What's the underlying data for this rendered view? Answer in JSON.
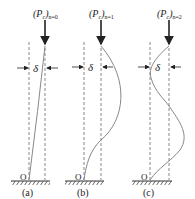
{
  "diagram": {
    "colors": {
      "line": "#333333",
      "curve": "#888888",
      "dashed": "#555555",
      "text": "#222222"
    },
    "panels": [
      {
        "id": "a",
        "load_label_main": "(P",
        "load_label_sub_c": "c",
        "load_label_close": ")",
        "load_label_sub_n": "n=0",
        "delta_symbol": "δ",
        "origin_label": "O",
        "caption": "(a)"
      },
      {
        "id": "b",
        "load_label_main": "(P",
        "load_label_sub_c": "c",
        "load_label_close": ")",
        "load_label_sub_n": "n=1",
        "delta_symbol": "δ",
        "origin_label": "O",
        "caption": "(b)"
      },
      {
        "id": "c",
        "load_label_main": "(P",
        "load_label_sub_c": "c",
        "load_label_close": ")",
        "load_label_sub_n": "n=2",
        "delta_symbol": "δ",
        "origin_label": "O",
        "caption": "(c)"
      }
    ]
  }
}
